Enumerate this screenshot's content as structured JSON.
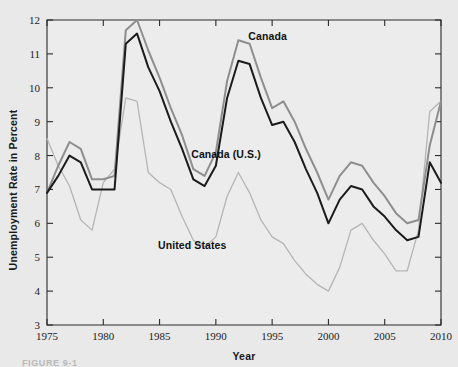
{
  "figure": {
    "caption": "FIGURE 9-1"
  },
  "chart_data": {
    "type": "line",
    "title": "",
    "xlabel": "Year",
    "ylabel": "Unemployment Rate in Percent",
    "xlim": [
      1975,
      2010
    ],
    "ylim": [
      3,
      12
    ],
    "xticks": [
      1975,
      1980,
      1985,
      1990,
      1995,
      2000,
      2005,
      2010
    ],
    "xtick_labels": [
      "1975",
      "1980",
      "1985",
      "1990",
      "1995",
      "2000",
      "2005",
      "2010"
    ],
    "yticks": [
      3,
      4,
      5,
      6,
      7,
      8,
      9,
      10,
      11,
      12
    ],
    "ytick_labels": [
      "3",
      "4",
      "5",
      "6",
      "7",
      "8",
      "9",
      "10",
      "11",
      "12"
    ],
    "grid": false,
    "legend": "inline-annotations",
    "x": [
      1975,
      1976,
      1977,
      1978,
      1979,
      1980,
      1981,
      1982,
      1983,
      1984,
      1985,
      1986,
      1987,
      1988,
      1989,
      1990,
      1991,
      1992,
      1993,
      1994,
      1995,
      1996,
      1997,
      1998,
      1999,
      2000,
      2001,
      2002,
      2003,
      2004,
      2005,
      2006,
      2007,
      2008,
      2009,
      2010
    ],
    "series": [
      {
        "name": "Canada",
        "color": "#8e8e8e",
        "width": 2.0,
        "values": [
          6.9,
          7.7,
          8.4,
          8.2,
          7.3,
          7.3,
          7.4,
          11.7,
          12.0,
          11.1,
          10.3,
          9.4,
          8.6,
          7.6,
          7.4,
          8.1,
          10.2,
          11.4,
          11.3,
          10.3,
          9.4,
          9.6,
          9.0,
          8.2,
          7.5,
          6.7,
          7.4,
          7.8,
          7.7,
          7.2,
          6.8,
          6.3,
          6.0,
          6.1,
          8.3,
          9.6
        ]
      },
      {
        "name": "Canada (U.S.)",
        "color": "#1b1b1b",
        "width": 2.0,
        "values": [
          6.9,
          7.4,
          8.0,
          7.8,
          7.0,
          7.0,
          7.0,
          11.3,
          11.6,
          10.6,
          9.9,
          9.0,
          8.2,
          7.3,
          7.1,
          7.7,
          9.7,
          10.8,
          10.7,
          9.7,
          8.9,
          9.0,
          8.4,
          7.6,
          6.9,
          6.0,
          6.7,
          7.1,
          7.0,
          6.5,
          6.2,
          5.8,
          5.5,
          5.6,
          7.8,
          7.2
        ]
      },
      {
        "name": "United States",
        "color": "#b5b5b5",
        "width": 1.3,
        "values": [
          8.5,
          7.7,
          7.1,
          6.1,
          5.8,
          7.2,
          7.6,
          9.7,
          9.6,
          7.5,
          7.2,
          7.0,
          6.2,
          5.5,
          5.3,
          5.6,
          6.8,
          7.5,
          6.9,
          6.1,
          5.6,
          5.4,
          4.9,
          4.5,
          4.2,
          4.0,
          4.7,
          5.8,
          6.0,
          5.5,
          5.1,
          4.6,
          4.6,
          5.8,
          9.3,
          9.6
        ]
      }
    ],
    "annotations": [
      {
        "name": "Canada",
        "text": "Canada",
        "x": 1994.6,
        "y": 11.42
      },
      {
        "name": "Canada (U.S.)",
        "text": "Canada (U.S.)",
        "x": 1990.9,
        "y": 7.94
      },
      {
        "name": "United States",
        "text": "United States",
        "x": 1987.9,
        "y": 5.23
      }
    ]
  }
}
